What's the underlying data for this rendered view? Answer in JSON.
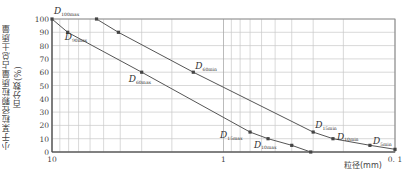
{
  "chart_data": {
    "type": "line",
    "title": "",
    "xlabel": "粒径(mm)",
    "ylabel": "小于某粒径颗粒质量占总土质量百分数(%)",
    "xscale": "log",
    "xlim": [
      10,
      0.1
    ],
    "ylim": [
      0,
      100
    ],
    "x_ticks": [
      "10",
      "1",
      "0.1"
    ],
    "y_ticks": [
      "0",
      "10",
      "20",
      "30",
      "40",
      "50",
      "60",
      "70",
      "80",
      "90",
      "100"
    ],
    "grid": true,
    "legend": null,
    "series": [
      {
        "name": "max",
        "points": [
          {
            "x": 10.0,
            "y": 100,
            "label": "D100max"
          },
          {
            "x": 8.1,
            "y": 90,
            "label": "D90max"
          },
          {
            "x": 3.0,
            "y": 60,
            "label": "D60max"
          },
          {
            "x": 0.7,
            "y": 15,
            "label": "D15max"
          },
          {
            "x": 0.55,
            "y": 10,
            "label": "D10max"
          },
          {
            "x": 0.4,
            "y": 5,
            "label": ""
          },
          {
            "x": 0.31,
            "y": 0,
            "label": ""
          }
        ]
      },
      {
        "name": "min",
        "points": [
          {
            "x": 5.5,
            "y": 100,
            "label": ""
          },
          {
            "x": 4.1,
            "y": 90,
            "label": ""
          },
          {
            "x": 1.5,
            "y": 60,
            "label": "D60min"
          },
          {
            "x": 0.3,
            "y": 15,
            "label": "D15min"
          },
          {
            "x": 0.23,
            "y": 10,
            "label": "D10min"
          },
          {
            "x": 0.14,
            "y": 5,
            "label": "D5min"
          },
          {
            "x": 0.1,
            "y": 2,
            "label": ""
          }
        ]
      }
    ],
    "annotations": [
      {
        "text": "D",
        "sub": "100max",
        "at": [
          10.0,
          100
        ]
      },
      {
        "text": "D",
        "sub": "90max",
        "at": [
          8.1,
          90
        ]
      },
      {
        "text": "D",
        "sub": "60max",
        "at": [
          3.0,
          60
        ]
      },
      {
        "text": "D",
        "sub": "15max",
        "at": [
          0.7,
          15
        ]
      },
      {
        "text": "D",
        "sub": "10max",
        "at": [
          0.55,
          10
        ]
      },
      {
        "text": "D",
        "sub": "60min",
        "at": [
          1.5,
          60
        ]
      },
      {
        "text": "D",
        "sub": "15min",
        "at": [
          0.3,
          15
        ]
      },
      {
        "text": "D",
        "sub": "10min",
        "at": [
          0.23,
          10
        ]
      },
      {
        "text": "D",
        "sub": "5min",
        "at": [
          0.14,
          5
        ]
      }
    ]
  },
  "axes": {
    "xlabel": "粒径(mm)",
    "ylabel": "小于某粒径颗粒质量占总土质量百分数(%)"
  }
}
